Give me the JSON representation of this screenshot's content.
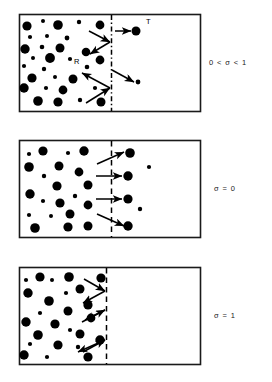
{
  "figure": {
    "type": "schematic-diagram",
    "title": "",
    "background_color": "#ffffff",
    "particle_color": "#000000",
    "frame_color": "#1a1a1a",
    "width": 272,
    "height": 382,
    "panels": [
      {
        "id": "panel-1",
        "label": "0 < σ < 1",
        "label_meaning": "partial accommodation coefficient between zero and one",
        "frame": {
          "x": 19,
          "y": 14,
          "width": 181,
          "height": 97
        },
        "divider": {
          "x": 111,
          "style": "dash-dot"
        },
        "annotations": [
          {
            "name": "transmitted-particle-label",
            "text": "T",
            "x": 146,
            "y": 24
          },
          {
            "name": "reflected-particle-label",
            "text": "R",
            "x": 74,
            "y": 64
          }
        ],
        "particles": [
          {
            "cx": 27,
            "cy": 26,
            "r": 4.6
          },
          {
            "cx": 43,
            "cy": 21,
            "r": 2.0
          },
          {
            "cx": 58,
            "cy": 25,
            "r": 4.8
          },
          {
            "cx": 79,
            "cy": 22,
            "r": 2.2
          },
          {
            "cx": 100,
            "cy": 25,
            "r": 4.4
          },
          {
            "cx": 30,
            "cy": 37,
            "r": 2.1
          },
          {
            "cx": 47,
            "cy": 36,
            "r": 2.0
          },
          {
            "cx": 67,
            "cy": 38,
            "r": 2.4
          },
          {
            "cx": 25,
            "cy": 49,
            "r": 4.7
          },
          {
            "cx": 42,
            "cy": 47,
            "r": 2.3
          },
          {
            "cx": 60,
            "cy": 48,
            "r": 4.5
          },
          {
            "cx": 86,
            "cy": 52,
            "r": 4.3
          },
          {
            "cx": 33,
            "cy": 58,
            "r": 2.0
          },
          {
            "cx": 50,
            "cy": 58,
            "r": 4.9
          },
          {
            "cx": 70,
            "cy": 59,
            "r": 2.1
          },
          {
            "cx": 100,
            "cy": 60,
            "r": 4.4
          },
          {
            "cx": 24,
            "cy": 66,
            "r": 2.1
          },
          {
            "cx": 44,
            "cy": 69,
            "r": 2.2
          },
          {
            "cx": 87,
            "cy": 67,
            "r": 2.3
          },
          {
            "cx": 32,
            "cy": 78,
            "r": 4.6
          },
          {
            "cx": 55,
            "cy": 77,
            "r": 2.0
          },
          {
            "cx": 73,
            "cy": 79,
            "r": 4.5
          },
          {
            "cx": 24,
            "cy": 88,
            "r": 4.7
          },
          {
            "cx": 46,
            "cy": 88,
            "r": 2.1
          },
          {
            "cx": 63,
            "cy": 90,
            "r": 4.4
          },
          {
            "cx": 95,
            "cy": 88,
            "r": 2.1
          },
          {
            "cx": 38,
            "cy": 101,
            "r": 4.8
          },
          {
            "cx": 58,
            "cy": 102,
            "r": 4.6
          },
          {
            "cx": 80,
            "cy": 100,
            "r": 2.2
          },
          {
            "cx": 101,
            "cy": 102,
            "r": 4.5
          },
          {
            "cx": 136,
            "cy": 31,
            "r": 4.5
          },
          {
            "cx": 138,
            "cy": 82,
            "r": 2.4
          }
        ],
        "arrows": [
          {
            "name": "incident-arrow-upper",
            "x1": 89,
            "y1": 31,
            "x2": 110,
            "y2": 42,
            "head": "end"
          },
          {
            "name": "reflected-arrow-upper",
            "x1": 110,
            "y1": 42,
            "x2": 90,
            "y2": 54,
            "head": "end"
          },
          {
            "name": "transmitted-arrow-upper",
            "x1": 115,
            "y1": 31,
            "x2": 131,
            "y2": 31,
            "head": "end"
          },
          {
            "name": "incident-arrow-lower",
            "x1": 86,
            "y1": 103,
            "x2": 110,
            "y2": 88,
            "head": "end"
          },
          {
            "name": "reflected-arrow-lower",
            "x1": 110,
            "y1": 88,
            "x2": 82,
            "y2": 73,
            "head": "end"
          },
          {
            "name": "transmitted-arrow-lower",
            "x1": 112,
            "y1": 70,
            "x2": 134,
            "y2": 82,
            "head": "end"
          }
        ]
      },
      {
        "id": "panel-2",
        "label": "σ = 0",
        "label_meaning": "zero accommodation, full specular transmission",
        "frame": {
          "x": 19,
          "y": 140,
          "width": 181,
          "height": 97
        },
        "divider": {
          "x": 111,
          "style": "dashed"
        },
        "annotations": [],
        "particles": [
          {
            "cx": 29,
            "cy": 154,
            "r": 2.1
          },
          {
            "cx": 43,
            "cy": 151,
            "r": 4.6
          },
          {
            "cx": 68,
            "cy": 153,
            "r": 2.1
          },
          {
            "cx": 84,
            "cy": 151,
            "r": 4.7
          },
          {
            "cx": 29,
            "cy": 167,
            "r": 4.8
          },
          {
            "cx": 59,
            "cy": 166,
            "r": 4.5
          },
          {
            "cx": 44,
            "cy": 176,
            "r": 2.2
          },
          {
            "cx": 79,
            "cy": 172,
            "r": 4.4
          },
          {
            "cx": 57,
            "cy": 186,
            "r": 4.6
          },
          {
            "cx": 88,
            "cy": 185,
            "r": 4.5
          },
          {
            "cx": 30,
            "cy": 194,
            "r": 4.7
          },
          {
            "cx": 75,
            "cy": 196,
            "r": 2.2
          },
          {
            "cx": 43,
            "cy": 201,
            "r": 2.1
          },
          {
            "cx": 60,
            "cy": 203,
            "r": 4.6
          },
          {
            "cx": 88,
            "cy": 205,
            "r": 4.4
          },
          {
            "cx": 29,
            "cy": 215,
            "r": 2.1
          },
          {
            "cx": 51,
            "cy": 216,
            "r": 2.0
          },
          {
            "cx": 70,
            "cy": 214,
            "r": 4.5
          },
          {
            "cx": 35,
            "cy": 228,
            "r": 4.8
          },
          {
            "cx": 68,
            "cy": 227,
            "r": 4.6
          },
          {
            "cx": 88,
            "cy": 226,
            "r": 4.5
          },
          {
            "cx": 130,
            "cy": 153,
            "r": 4.8
          },
          {
            "cx": 149,
            "cy": 167,
            "r": 2.1
          },
          {
            "cx": 128,
            "cy": 176,
            "r": 4.7
          },
          {
            "cx": 128,
            "cy": 199,
            "r": 4.6
          },
          {
            "cx": 140,
            "cy": 209,
            "r": 2.2
          },
          {
            "cx": 128,
            "cy": 226,
            "r": 4.7
          }
        ],
        "arrows": [
          {
            "name": "transmit-arrow-1",
            "x1": 97,
            "y1": 164,
            "x2": 124,
            "y2": 152,
            "head": "end"
          },
          {
            "name": "transmit-arrow-2",
            "x1": 96,
            "y1": 176,
            "x2": 122,
            "y2": 176,
            "head": "end"
          },
          {
            "name": "transmit-arrow-3",
            "x1": 96,
            "y1": 199,
            "x2": 122,
            "y2": 199,
            "head": "end"
          },
          {
            "name": "transmit-arrow-4",
            "x1": 97,
            "y1": 214,
            "x2": 124,
            "y2": 226,
            "head": "end"
          }
        ]
      },
      {
        "id": "panel-3",
        "label": "σ = 1",
        "label_meaning": "full accommodation, complete diffuse reflection",
        "frame": {
          "x": 19,
          "y": 267,
          "width": 181,
          "height": 97
        },
        "divider": {
          "x": 106,
          "style": "dashed"
        },
        "annotations": [],
        "particles": [
          {
            "cx": 26,
            "cy": 280,
            "r": 2.1
          },
          {
            "cx": 40,
            "cy": 277,
            "r": 4.6
          },
          {
            "cx": 52,
            "cy": 280,
            "r": 2.0
          },
          {
            "cx": 69,
            "cy": 277,
            "r": 4.8
          },
          {
            "cx": 101,
            "cy": 278,
            "r": 4.6
          },
          {
            "cx": 80,
            "cy": 289,
            "r": 4.5
          },
          {
            "cx": 28,
            "cy": 293,
            "r": 4.7
          },
          {
            "cx": 66,
            "cy": 293,
            "r": 2.1
          },
          {
            "cx": 49,
            "cy": 301,
            "r": 4.8
          },
          {
            "cx": 88,
            "cy": 305,
            "r": 4.6
          },
          {
            "cx": 40,
            "cy": 313,
            "r": 2.1
          },
          {
            "cx": 68,
            "cy": 311,
            "r": 4.5
          },
          {
            "cx": 91,
            "cy": 318,
            "r": 4.4
          },
          {
            "cx": 26,
            "cy": 322,
            "r": 4.7
          },
          {
            "cx": 55,
            "cy": 324,
            "r": 4.6
          },
          {
            "cx": 70,
            "cy": 330,
            "r": 2.1
          },
          {
            "cx": 38,
            "cy": 335,
            "r": 4.8
          },
          {
            "cx": 80,
            "cy": 334,
            "r": 4.5
          },
          {
            "cx": 30,
            "cy": 344,
            "r": 2.1
          },
          {
            "cx": 58,
            "cy": 345,
            "r": 4.6
          },
          {
            "cx": 78,
            "cy": 347,
            "r": 2.2
          },
          {
            "cx": 100,
            "cy": 340,
            "r": 4.7
          },
          {
            "cx": 24,
            "cy": 355,
            "r": 4.7
          },
          {
            "cx": 47,
            "cy": 357,
            "r": 2.1
          },
          {
            "cx": 88,
            "cy": 357,
            "r": 4.6
          }
        ],
        "arrows": [
          {
            "name": "incident-arrow-1",
            "x1": 84,
            "y1": 279,
            "x2": 105,
            "y2": 291,
            "head": "end"
          },
          {
            "name": "reflect-arrow-1",
            "x1": 105,
            "y1": 291,
            "x2": 83,
            "y2": 303,
            "head": "end"
          },
          {
            "name": "incident-arrow-2",
            "x1": 82,
            "y1": 322,
            "x2": 105,
            "y2": 310,
            "head": "end"
          },
          {
            "name": "reflect-arrow-2",
            "x1": 105,
            "y1": 310,
            "x2": 85,
            "y2": 320,
            "head": "end"
          },
          {
            "name": "incident-arrow-3",
            "x1": 83,
            "y1": 352,
            "x2": 105,
            "y2": 340,
            "head": "end"
          },
          {
            "name": "reflect-arrow-3",
            "x1": 105,
            "y1": 340,
            "x2": 78,
            "y2": 352,
            "head": "end"
          }
        ]
      }
    ]
  }
}
